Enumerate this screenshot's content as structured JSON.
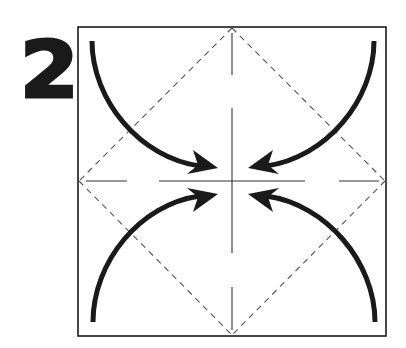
{
  "step": {
    "number": "2"
  },
  "diagram": {
    "colors": {
      "ink": "#1a1a1a",
      "crease": "#555555",
      "paper": "#ffffff"
    },
    "square": {
      "x": 78,
      "y": 27,
      "size": 308
    },
    "center": {
      "x": 232,
      "y": 181
    },
    "valley_fold_lines": [
      "diamond connecting edge midpoints (dashed)"
    ],
    "crease_lines": [
      "vertical center (dash-dot)",
      "horizontal center (dash-dot)"
    ],
    "arrows": [
      {
        "name": "top-left-corner-arrow",
        "from": "top-left corner",
        "to": "center"
      },
      {
        "name": "top-right-corner-arrow",
        "from": "top-right corner",
        "to": "center"
      },
      {
        "name": "bottom-left-corner-arrow",
        "from": "bottom-left corner",
        "to": "center"
      },
      {
        "name": "bottom-right-corner-arrow",
        "from": "bottom-right corner",
        "to": "center"
      }
    ]
  }
}
